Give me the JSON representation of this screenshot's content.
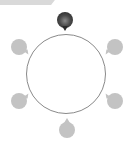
{
  "header": {
    "label": ""
  },
  "ring": {
    "stroke_color": "#8a8a8a"
  },
  "markers": [
    {
      "id": "top",
      "state": "active",
      "icon": "map-pin-icon",
      "color": "#2a2a2a"
    },
    {
      "id": "upper-left",
      "state": "inactive",
      "icon": "map-pin-icon",
      "color": "#c3c3c3"
    },
    {
      "id": "upper-right",
      "state": "inactive",
      "icon": "map-pin-icon",
      "color": "#c3c3c3"
    },
    {
      "id": "lower-left",
      "state": "inactive",
      "icon": "map-pin-icon",
      "color": "#c3c3c3"
    },
    {
      "id": "lower-right",
      "state": "inactive",
      "icon": "map-pin-icon",
      "color": "#c3c3c3"
    },
    {
      "id": "bottom",
      "state": "inactive",
      "icon": "map-pin-icon",
      "color": "#c3c3c3"
    }
  ]
}
